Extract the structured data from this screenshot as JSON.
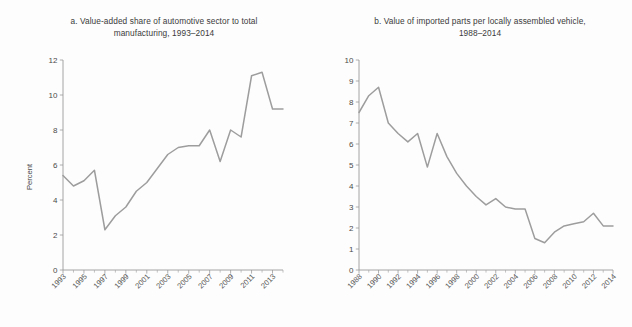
{
  "figure": {
    "background_color": "#fdfdfd",
    "line_color": "#9d9d9d",
    "axis_color": "#9a9a9a",
    "text_color": "#3b3b3b"
  },
  "panel_a": {
    "title_line1": "a. Value-added share of automotive sector to total",
    "title_line2": "manufacturing, 1993–2014",
    "ylabel": "Percent"
  },
  "panel_b": {
    "title_line1": "b. Value of imported parts per locally assembled vehicle,",
    "title_line2": "1988–2014",
    "ylabel": "US$million/1,000 units"
  },
  "chart_data": [
    {
      "type": "line",
      "panel": "a",
      "title": "a. Value-added share of automotive sector to total manufacturing, 1993–2014",
      "xlabel": "",
      "ylabel": "Percent",
      "ylim": [
        0,
        12
      ],
      "yticks": [
        0,
        2,
        4,
        6,
        8,
        10,
        12
      ],
      "ytick_labels": [
        "0",
        "2",
        "4",
        "6",
        "8",
        "10",
        "12"
      ],
      "xlim": [
        1993,
        2014
      ],
      "xticks": [
        1993,
        1995,
        1997,
        1999,
        2001,
        2003,
        2005,
        2007,
        2009,
        2011,
        2013
      ],
      "xtick_labels": [
        "1993",
        "1995",
        "1997",
        "1999",
        "2001",
        "2003",
        "2005",
        "2007",
        "2009",
        "2011",
        "2013"
      ],
      "xtick_minor_every": 1,
      "grid": false,
      "legend": false,
      "x": [
        1993,
        1994,
        1995,
        1996,
        1997,
        1998,
        1999,
        2000,
        2001,
        2002,
        2003,
        2004,
        2005,
        2006,
        2007,
        2008,
        2009,
        2010,
        2011,
        2012,
        2013,
        2014
      ],
      "values": [
        5.4,
        4.8,
        5.1,
        5.7,
        2.3,
        3.1,
        3.6,
        4.5,
        5.0,
        5.8,
        6.6,
        7.0,
        7.1,
        7.1,
        8.0,
        6.2,
        8.0,
        7.6,
        11.1,
        11.3,
        9.2,
        9.2
      ],
      "series": [
        {
          "name": "Value-added share",
          "values": [
            5.4,
            4.8,
            5.1,
            5.7,
            2.3,
            3.1,
            3.6,
            4.5,
            5.0,
            5.8,
            6.6,
            7.0,
            7.1,
            7.1,
            8.0,
            6.2,
            8.0,
            7.6,
            11.1,
            11.3,
            9.2,
            9.2
          ]
        }
      ]
    },
    {
      "type": "line",
      "panel": "b",
      "title": "b. Value of imported parts per locally assembled vehicle, 1988–2014",
      "xlabel": "",
      "ylabel": "US$million/1,000 units",
      "ylim": [
        0,
        10
      ],
      "yticks": [
        0,
        1,
        2,
        3,
        4,
        5,
        6,
        7,
        8,
        9,
        10
      ],
      "ytick_labels": [
        "0",
        "1",
        "2",
        "3",
        "4",
        "5",
        "6",
        "7",
        "8",
        "9",
        "10"
      ],
      "xlim": [
        1988,
        2014
      ],
      "xticks": [
        1988,
        1990,
        1992,
        1994,
        1996,
        1998,
        2000,
        2002,
        2004,
        2006,
        2008,
        2010,
        2012,
        2014
      ],
      "xtick_labels": [
        "1988",
        "1990",
        "1992",
        "1994",
        "1996",
        "1998",
        "2000",
        "2002",
        "2004",
        "2006",
        "2008",
        "2010",
        "2012",
        "2014"
      ],
      "xtick_minor_every": 1,
      "grid": false,
      "legend": false,
      "x": [
        1988,
        1989,
        1990,
        1991,
        1992,
        1993,
        1994,
        1995,
        1996,
        1997,
        1998,
        1999,
        2000,
        2001,
        2002,
        2003,
        2004,
        2005,
        2006,
        2007,
        2008,
        2009,
        2010,
        2011,
        2012,
        2013,
        2014
      ],
      "values": [
        7.5,
        8.3,
        8.7,
        7.0,
        6.5,
        6.1,
        6.5,
        4.9,
        6.5,
        5.4,
        4.6,
        4.0,
        3.5,
        3.1,
        3.4,
        3.0,
        2.9,
        2.9,
        1.5,
        1.3,
        1.8,
        2.1,
        2.2,
        2.3,
        2.7,
        2.1,
        2.1
      ],
      "series": [
        {
          "name": "Imported parts value per vehicle",
          "values": [
            7.5,
            8.3,
            8.7,
            7.0,
            6.5,
            6.1,
            6.5,
            4.9,
            6.5,
            5.4,
            4.6,
            4.0,
            3.5,
            3.1,
            3.4,
            3.0,
            2.9,
            2.9,
            1.5,
            1.3,
            1.8,
            2.1,
            2.2,
            2.3,
            2.7,
            2.1,
            2.1
          ]
        }
      ]
    }
  ]
}
